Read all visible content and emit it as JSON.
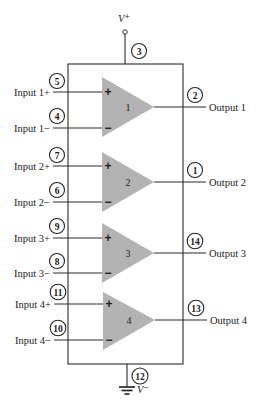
{
  "colors": {
    "triangle_fill": "#b3b3b3",
    "line": "#2a2a2a",
    "text": "#1a1a1a",
    "background": "#ffffff"
  },
  "supply": {
    "vplus_label": "V⁺",
    "vplus_pin": "3",
    "vminus_label": "V⁻",
    "vminus_pin": "12"
  },
  "amplifiers": [
    {
      "number": "1",
      "input_plus_label": "Input 1+",
      "input_plus_pin": "5",
      "input_minus_label": "Input 1−",
      "input_minus_pin": "4",
      "output_label": "Output 1",
      "output_pin": "2",
      "plus_sign": "+",
      "minus_sign": "−"
    },
    {
      "number": "2",
      "input_plus_label": "Input 2+",
      "input_plus_pin": "7",
      "input_minus_label": "Input 2−",
      "input_minus_pin": "6",
      "output_label": "Output 2",
      "output_pin": "1",
      "plus_sign": "+",
      "minus_sign": "−"
    },
    {
      "number": "3",
      "input_plus_label": "Input 3+",
      "input_plus_pin": "9",
      "input_minus_label": "Input 3−",
      "input_minus_pin": "8",
      "output_label": "Output 3",
      "output_pin": "14",
      "plus_sign": "+",
      "minus_sign": "−"
    },
    {
      "number": "4",
      "input_plus_label": "Input 4+",
      "input_plus_pin": "11",
      "input_minus_label": "Input 4−",
      "input_minus_pin": "10",
      "output_label": "Output 4",
      "output_pin": "13",
      "plus_sign": "+",
      "minus_sign": "−"
    }
  ]
}
